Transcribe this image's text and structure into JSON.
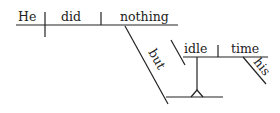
{
  "diagram": {
    "type": "sentence-diagram",
    "sentence": "He did nothing but idle his time",
    "words": {
      "subject": "He",
      "verb": "did",
      "object": "nothing",
      "conjunction": "but",
      "modifier_verb": "idle",
      "modifier_object": "time",
      "possessive": "his"
    },
    "line_color": "#222222",
    "text_color": "#222222"
  }
}
